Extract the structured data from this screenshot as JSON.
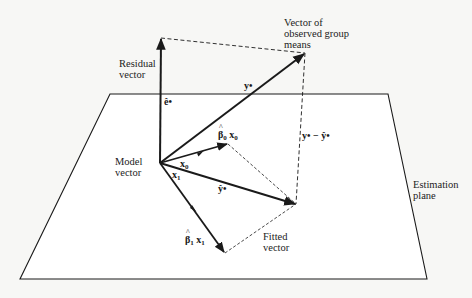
{
  "diagram": {
    "colors": {
      "background": "#f7f7f5",
      "ink": "#1a1a1a"
    },
    "labels": {
      "residual_vector": [
        "Residual",
        "vector"
      ],
      "observed_means": [
        "Vector of",
        "observed group",
        "means"
      ],
      "model_vector": [
        "Model",
        "vector"
      ],
      "estimation_plane": [
        "Estimation",
        "plane"
      ],
      "fitted_vector": [
        "Fitted",
        "vector"
      ]
    },
    "math_labels": {
      "e_hat": "ê•",
      "y_dot": "y•",
      "y_minus_yhat": "y• − ŷ•",
      "beta0_x0_beta": "β",
      "beta0_x0_sub": "0",
      "beta0_x0_x": "x",
      "beta0_x0_xsub": "0",
      "x0": "x",
      "x0_sub": "0",
      "x1": "x",
      "x1_sub": "1",
      "y_hat": "ŷ•",
      "beta1_x1_beta": "β",
      "beta1_x1_sub": "1",
      "beta1_x1_x": "x",
      "beta1_x1_xsub": "1"
    },
    "geometry": {
      "origin": [
        160,
        163
      ],
      "residual_tip": [
        161,
        38
      ],
      "observed_tip": [
        305,
        53
      ],
      "fitted_tip": [
        296,
        204
      ],
      "beta0x0_tip": [
        228,
        144
      ],
      "beta1x1_tip": [
        225,
        253
      ],
      "plane": [
        [
          110,
          94
        ],
        [
          388,
          94
        ],
        [
          427,
          279
        ],
        [
          20,
          279
        ]
      ]
    }
  }
}
